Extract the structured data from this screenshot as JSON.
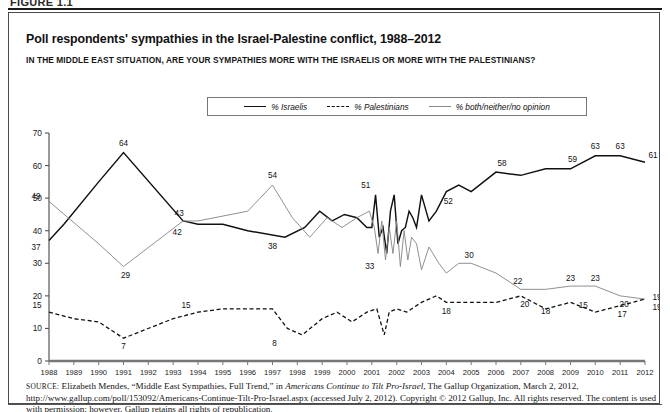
{
  "figure": {
    "label": "FIGURE 1.1"
  },
  "title": "Poll respondents' sympathies in the Israel-Palestine conflict, 1988–2012",
  "subtitle": "IN THE MIDDLE EAST SITUATION, ARE YOUR SYMPATHIES MORE WITH THE ISRAELIS OR MORE WITH THE PALESTINIANS?",
  "legend": {
    "items": [
      {
        "label": "% Israelis",
        "style": "solid",
        "color": "#111111"
      },
      {
        "label": "% Palestinians",
        "style": "dashed",
        "color": "#111111"
      },
      {
        "label": "% both/neither/no opinion",
        "style": "thin-solid",
        "color": "#8a8a8a"
      }
    ]
  },
  "source": {
    "prefix": "SOURCE:",
    "line1_a": " Elizabeth Mendes, “Middle East Sympathies, Full Trend,” in ",
    "line1_italic": "Americans Continue to Tilt Pro-Israel",
    "line1_b": ", The Gallup Organization, March 2, 2012,",
    "line2": "http://www.gallup.com/poll/153092/Americans-Continue-Tilt-Pro-Israel.aspx (accessed July 2, 2012). Copyright © 2012 Gallup, Inc. All rights reserved.",
    "line3": "The content is used with permission; however, Gallup retains all rights of republication."
  },
  "chart_data": {
    "type": "line",
    "title": "Poll respondents' sympathies in the Israel-Palestine conflict, 1988–2012",
    "xlabel": "",
    "ylabel": "",
    "ylim": [
      0,
      70
    ],
    "yticks": [
      0,
      10,
      20,
      30,
      40,
      50,
      60,
      70
    ],
    "xlim": [
      1988,
      2012
    ],
    "grid": false,
    "legend_position": "top-center",
    "categories": [
      "1988",
      "1989",
      "1990",
      "1991",
      "1992",
      "1993",
      "1994",
      "1995",
      "1996",
      "1997",
      "1998",
      "1999",
      "2000",
      "2001",
      "2002",
      "2003",
      "2004",
      "2005",
      "2006",
      "2007",
      "2008",
      "2009",
      "2010",
      "2011",
      "2012"
    ],
    "series": [
      {
        "name": "% Israelis",
        "style": "solid",
        "color": "#111111",
        "x": [
          1988.0,
          1988.6,
          1990.0,
          1991.0,
          1993.4,
          1994.0,
          1995.0,
          1996.0,
          1997.5,
          1998.3,
          1998.9,
          1999.4,
          1999.9,
          2000.4,
          2000.8,
          2001.0,
          2001.15,
          2001.3,
          2001.45,
          2001.6,
          2001.75,
          2001.9,
          2002.05,
          2002.2,
          2002.35,
          2002.5,
          2002.65,
          2002.8,
          2003.0,
          2003.3,
          2003.6,
          2004.0,
          2004.5,
          2005.0,
          2006.0,
          2007.0,
          2008.0,
          2009.0,
          2010.0,
          2011.0,
          2012.0
        ],
        "values": [
          37,
          42,
          55,
          64,
          43,
          42,
          42,
          40,
          38,
          41,
          46,
          43,
          45,
          44,
          41,
          41,
          51,
          38,
          41,
          33,
          46,
          51,
          36,
          40,
          41,
          46,
          44,
          41,
          51,
          43,
          46,
          52,
          54,
          52,
          58,
          57,
          59,
          59,
          63,
          63,
          61
        ]
      },
      {
        "name": "% both/neither/no opinion",
        "style": "thin-solid",
        "color": "#8a8a8a",
        "x": [
          1988.0,
          1990.0,
          1991.0,
          1993.4,
          1994.0,
          1996.0,
          1997.0,
          1997.8,
          1998.5,
          1999.2,
          1999.8,
          2000.4,
          2000.9,
          2001.1,
          2001.25,
          2001.4,
          2001.55,
          2001.7,
          2001.85,
          2002.0,
          2002.15,
          2002.3,
          2002.45,
          2002.6,
          2002.8,
          2003.0,
          2003.3,
          2003.7,
          2004.0,
          2004.5,
          2005.0,
          2006.0,
          2007.0,
          2008.0,
          2009.0,
          2010.0,
          2011.0,
          2012.0
        ],
        "values": [
          49,
          36,
          29,
          43,
          43,
          46,
          54,
          44,
          38,
          44,
          41,
          44,
          46,
          41,
          33,
          43,
          31,
          41,
          33,
          43,
          29,
          40,
          31,
          38,
          36,
          28,
          35,
          30,
          27,
          30,
          30,
          27,
          22,
          22,
          23,
          23,
          20,
          19
        ]
      },
      {
        "name": "% Palestinians",
        "style": "dashed",
        "color": "#111111",
        "x": [
          1988.0,
          1989.0,
          1990.0,
          1991.0,
          1993.0,
          1994.0,
          1995.0,
          1996.0,
          1997.0,
          1997.6,
          1998.2,
          1999.0,
          1999.6,
          2000.2,
          2000.8,
          2001.2,
          2001.5,
          2001.7,
          2002.0,
          2002.4,
          2003.0,
          2003.6,
          2004.0,
          2005.0,
          2006.0,
          2007.0,
          2008.0,
          2009.0,
          2010.0,
          2011.0,
          2012.0
        ],
        "values": [
          15,
          13,
          12,
          7,
          13,
          15,
          16,
          16,
          16,
          10,
          8,
          13,
          15,
          12,
          15,
          16,
          8,
          15,
          16,
          15,
          18,
          20,
          18,
          18,
          18,
          20,
          16,
          18,
          15,
          17,
          19
        ]
      }
    ],
    "point_labels": [
      {
        "series": "% both/neither/no opinion",
        "year": 1988,
        "value": 49,
        "text": "49"
      },
      {
        "series": "% Israelis",
        "year": 1988,
        "value": 37,
        "text": "37"
      },
      {
        "series": "% Palestinians",
        "year": 1988,
        "value": 15,
        "text": "15"
      },
      {
        "series": "% Israelis",
        "year": 1991,
        "value": 64,
        "text": "64"
      },
      {
        "series": "% both/neither/no opinion",
        "year": 1991,
        "value": 29,
        "text": "29"
      },
      {
        "series": "% Palestinians",
        "year": 1991,
        "value": 7,
        "text": "7"
      },
      {
        "series": "% both/neither/no opinion",
        "year": 1993,
        "value": 43,
        "text": "43"
      },
      {
        "series": "% Israelis",
        "year": 1993,
        "value": 42,
        "text": "42"
      },
      {
        "series": "% Palestinians",
        "year": 1994,
        "value": 15,
        "text": "15"
      },
      {
        "series": "% both/neither/no opinion",
        "year": 1997,
        "value": 54,
        "text": "54"
      },
      {
        "series": "% Israelis",
        "year": 1997,
        "value": 38,
        "text": "38"
      },
      {
        "series": "% Palestinians",
        "year": 1997,
        "value": 8,
        "text": "8"
      },
      {
        "series": "% Israelis",
        "year": 2001,
        "value": 51,
        "text": "51"
      },
      {
        "series": "% Israelis",
        "year": 2001,
        "value": 33,
        "text": "33"
      },
      {
        "series": "% Israelis",
        "year": 2004,
        "value": 52,
        "text": "52"
      },
      {
        "series": "% both/neither/no opinion",
        "year": 2005,
        "value": 30,
        "text": "30"
      },
      {
        "series": "% Palestinians",
        "year": 2004,
        "value": 18,
        "text": "18"
      },
      {
        "series": "% Israelis",
        "year": 2006,
        "value": 58,
        "text": "58"
      },
      {
        "series": "% both/neither/no opinion",
        "year": 2007,
        "value": 22,
        "text": "22"
      },
      {
        "series": "% Palestinians",
        "year": 2007,
        "value": 20,
        "text": "20"
      },
      {
        "series": "% Palestinians",
        "year": 2008,
        "value": 18,
        "text": "18"
      },
      {
        "series": "% both/neither/no opinion",
        "year": 2009,
        "value": 23,
        "text": "23"
      },
      {
        "series": "% Israelis",
        "year": 2009,
        "value": 59,
        "text": "59"
      },
      {
        "series": "% both/neither/no opinion",
        "year": 2010,
        "value": 23,
        "text": "23"
      },
      {
        "series": "% Palestinians",
        "year": 2010,
        "value": 15,
        "text": "15"
      },
      {
        "series": "% Israelis",
        "year": 2010,
        "value": 63,
        "text": "63"
      },
      {
        "series": "% Israelis",
        "year": 2011,
        "value": 63,
        "text": "63"
      },
      {
        "series": "% both/neither/no opinion",
        "year": 2011,
        "value": 20,
        "text": "20"
      },
      {
        "series": "% Palestinians",
        "year": 2011,
        "value": 17,
        "text": "17"
      },
      {
        "series": "% Israelis",
        "year": 2012,
        "value": 61,
        "text": "61"
      },
      {
        "series": "% both/neither/no opinion",
        "year": 2012,
        "value": 19,
        "text": "19"
      },
      {
        "series": "% Palestinians",
        "year": 2012,
        "value": 19,
        "text": "19"
      }
    ]
  }
}
